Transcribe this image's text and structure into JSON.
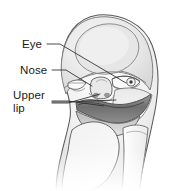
{
  "figure": {
    "kind": "anatomical-line-illustration",
    "background_color": "#ffffff",
    "line_color": "#4a4a4a",
    "text_color": "#1a1a1a",
    "shading": {
      "skin_light": "#f4f4f4",
      "skin_mid": "#e2e2e2",
      "skin_shadow": "#c9c9c9",
      "forehead_highlight": "#ededed",
      "lip_dark": "#7d7d7d",
      "lip_darker": "#636363",
      "eye_white": "#fbfbfb",
      "pupil": "#3d3d3d"
    }
  },
  "annotations": [
    {
      "id": "eye",
      "label": "Eye",
      "lines": [
        "Eye"
      ]
    },
    {
      "id": "nose",
      "label": "Nose",
      "lines": [
        "Nose"
      ]
    },
    {
      "id": "upper-lip",
      "label": "Upper lip",
      "lines": [
        "Upper",
        "lip"
      ]
    }
  ]
}
